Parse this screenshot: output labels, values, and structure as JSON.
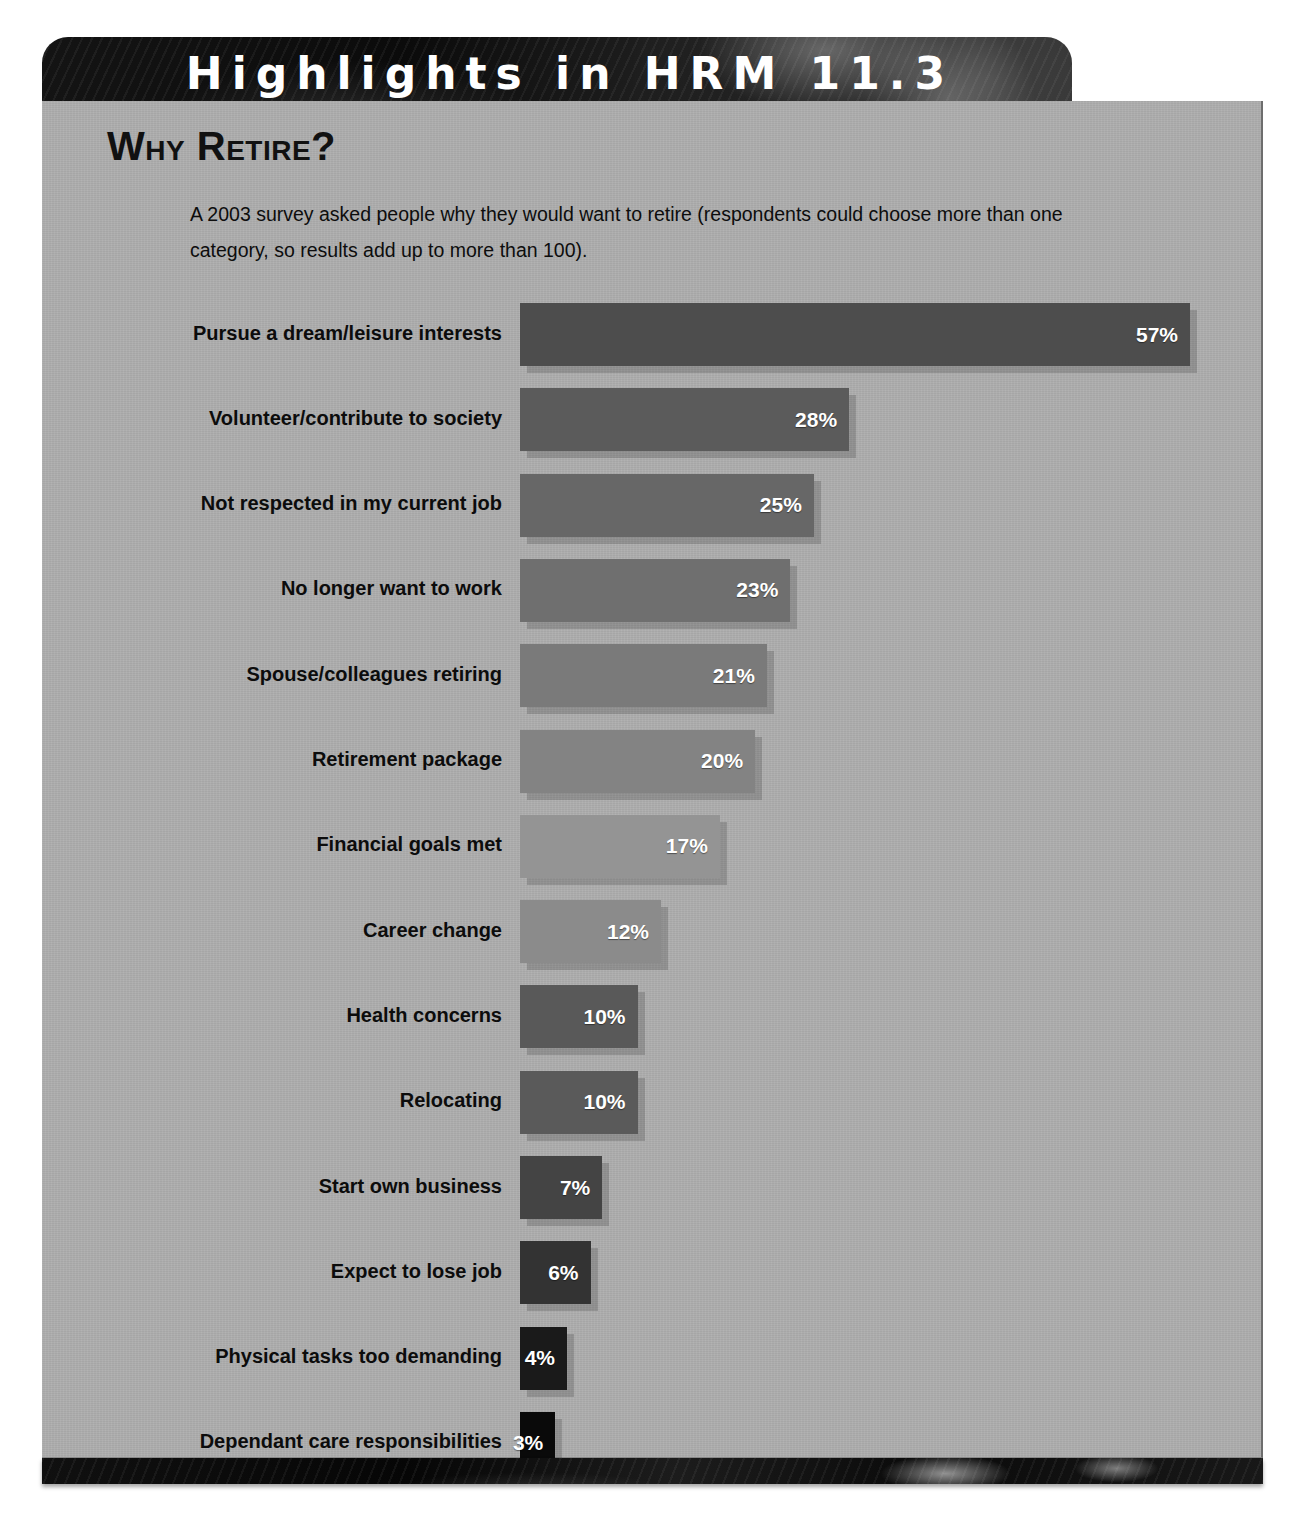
{
  "header": {
    "title": "Highlights in HRM 11.3"
  },
  "section": {
    "title": "Why Retire?",
    "intro": "A 2003 survey asked people why they would want to retire (respondents could choose more than one category, so results add up to more than 100)."
  },
  "chart_data": {
    "type": "bar",
    "orientation": "horizontal",
    "title": "Why Retire?",
    "subtitle": "A 2003 survey asked people why they would want to retire (respondents could choose more than one category, so results add up to more than 100).",
    "xlabel": "",
    "ylabel": "",
    "xlim": [
      0,
      57
    ],
    "grid": false,
    "legend": null,
    "value_suffix": "%",
    "categories": [
      "Pursue a dream/leisure interests",
      "Volunteer/contribute to society",
      "Not respected in my current job",
      "No longer want to work",
      "Spouse/colleagues retiring",
      "Retirement package",
      "Financial goals met",
      "Career change",
      "Health concerns",
      "Relocating",
      "Start own business",
      "Expect to lose job",
      "Physical tasks too demanding",
      "Dependant care responsibilities"
    ],
    "values": [
      57,
      28,
      25,
      23,
      21,
      20,
      17,
      12,
      10,
      10,
      7,
      6,
      4,
      3
    ],
    "value_labels": [
      "57%",
      "28%",
      "25%",
      "23%",
      "21%",
      "20%",
      "17%",
      "12%",
      "10%",
      "10%",
      "7%",
      "6%",
      "4%",
      "3%"
    ],
    "bar_colors": [
      "#4d4d4d",
      "#5b5b5b",
      "#676767",
      "#6f6f6f",
      "#7a7a7a",
      "#838383",
      "#949494",
      "#8b8b8b",
      "#595959",
      "#5a5a5a",
      "#444444",
      "#333333",
      "#1a1a1a",
      "#0a0a0a"
    ]
  },
  "colors": {
    "panel_bg": "#adadad",
    "header_bg": "#0e0e0e",
    "header_text": "#ffffff",
    "label_text": "#0c0c0c",
    "value_text": "#ffffff"
  }
}
